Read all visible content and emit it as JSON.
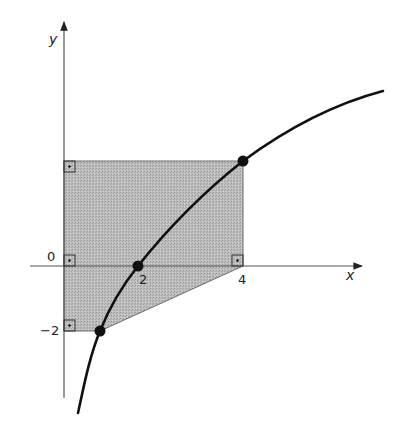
{
  "figure": {
    "axes": {
      "x_label": "x",
      "y_label": "y",
      "tick_labels": {
        "origin": "0",
        "x2": "2",
        "x4": "4",
        "y_neg2": "−2"
      }
    },
    "shaded_region": {
      "description": "Pentagon bounded by y-axis, horizontal line at top, vertical line x=4, segment from (4,0) to lower curve point, horizontal line at y=-2",
      "fill": "#b4b4b4",
      "vertices_px": [
        [
          64,
          161
        ],
        [
          243,
          161
        ],
        [
          243,
          266
        ],
        [
          100,
          331
        ],
        [
          64,
          331
        ]
      ]
    },
    "curve": {
      "description": "Increasing concave curve (logarithmic shape) passing through three marked points",
      "marked_points": [
        "lower point at y=-2",
        "(2, 0)",
        "upper point at x=4"
      ]
    },
    "right_angle_markers": [
      "top-left corner at y-axis",
      "origin",
      "(4, 0)",
      "bottom-left corner at y=-2"
    ],
    "colors": {
      "axis": "#555555",
      "curve": "#111111",
      "region_fill": "#b4b4b4",
      "region_edge": "#6a6a6a"
    }
  }
}
